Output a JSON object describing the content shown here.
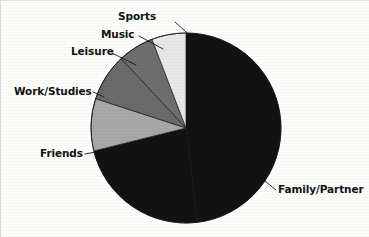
{
  "chart_data": {
    "type": "pie",
    "title": "",
    "subtitle": "",
    "xlabel": "",
    "ylabel": "",
    "grid": false,
    "legend_position": "none",
    "label_placement": "external-with-leader-lines",
    "center": {
      "x": 186,
      "y": 128
    },
    "radius": 95,
    "start_angle_deg": 0,
    "direction": "clockwise",
    "categories": [
      "Family/Partner",
      "Friends",
      "Work/Studies",
      "Leisure",
      "Music",
      "Sports"
    ],
    "values": [
      48,
      23,
      9,
      8,
      6,
      6
    ],
    "colors": [
      "#121212",
      "#121212",
      "#a8a8a8",
      "#6a6a6a",
      "#6e6e6e",
      "#e8e8e8"
    ],
    "slices": [
      {
        "label": "Family/Partner",
        "value": 48,
        "color": "#121212",
        "start_deg": 0,
        "end_deg": 173
      },
      {
        "label": "Friends",
        "value": 23,
        "color": "#121212",
        "start_deg": 173,
        "end_deg": 256
      },
      {
        "label": "Work/Studies",
        "value": 9,
        "color": "#a8a8a8",
        "start_deg": 256,
        "end_deg": 288
      },
      {
        "label": "Leisure",
        "value": 8,
        "color": "#6a6a6a",
        "start_deg": 288,
        "end_deg": 317
      },
      {
        "label": "Music",
        "value": 6,
        "color": "#6e6e6e",
        "start_deg": 317,
        "end_deg": 339
      },
      {
        "label": "Sports",
        "value": 6,
        "color": "#e8e8e8",
        "start_deg": 339,
        "end_deg": 360
      }
    ]
  },
  "labels": {
    "sports": "Sports",
    "music": "Music",
    "leisure": "Leisure",
    "work_studies": "Work/Studies",
    "friends": "Friends",
    "family_partner": "Family/Partner"
  },
  "style": {
    "background": "#fdfdfc",
    "label_color": "#121212",
    "leader_line_color": "#1a1a1a",
    "slice_outline_color": "#1b1b1b"
  }
}
